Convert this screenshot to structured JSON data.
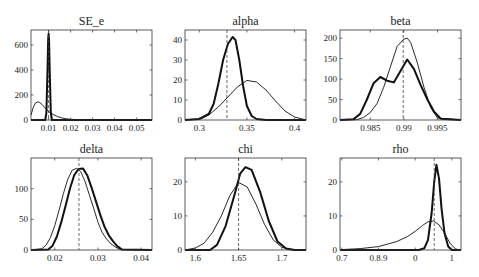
{
  "figure": {
    "line_color": "#111111",
    "frame_color": "#333333"
  },
  "chart_data": [
    {
      "type": "line",
      "title": "SE_e",
      "xlim": [
        0.002,
        0.057
      ],
      "ylim": [
        0,
        720
      ],
      "xticks": [
        0.01,
        0.02,
        0.03,
        0.04,
        0.05
      ],
      "xtick_labels": [
        "0.01",
        "0.02",
        "0.03",
        "0.04",
        "0.05"
      ],
      "yticks": [
        0,
        200,
        400,
        600
      ],
      "ytick_labels": [
        "0",
        "200",
        "400",
        "600"
      ],
      "mode_line": 0.01,
      "series": [
        {
          "name": "prior",
          "style": "thin",
          "x": [
            0.002,
            0.003,
            0.004,
            0.005,
            0.006,
            0.007,
            0.008,
            0.009,
            0.01,
            0.012,
            0.014,
            0.016,
            0.018,
            0.02,
            0.025,
            0.03,
            0.057
          ],
          "y": [
            40,
            100,
            135,
            145,
            140,
            125,
            105,
            85,
            68,
            45,
            28,
            17,
            10,
            6,
            2,
            1,
            0
          ]
        },
        {
          "name": "posterior",
          "style": "thick",
          "x": [
            0.002,
            0.0085,
            0.009,
            0.0095,
            0.0098,
            0.01,
            0.0102,
            0.0105,
            0.011,
            0.0115,
            0.057
          ],
          "y": [
            0,
            0,
            60,
            400,
            650,
            690,
            650,
            400,
            60,
            0,
            0
          ]
        }
      ]
    },
    {
      "type": "line",
      "title": "alpha",
      "xlim": [
        0.285,
        0.412
      ],
      "ylim": [
        0,
        45
      ],
      "xticks": [
        0.3,
        0.35,
        0.4
      ],
      "xtick_labels": [
        "0.3",
        "0.35",
        "0.4"
      ],
      "yticks": [
        0,
        10,
        20,
        30,
        40
      ],
      "ytick_labels": [
        "0",
        "10",
        "20",
        "30",
        "40"
      ],
      "mode_line": 0.329,
      "series": [
        {
          "name": "prior",
          "style": "thin",
          "x": [
            0.285,
            0.3,
            0.31,
            0.32,
            0.33,
            0.34,
            0.35,
            0.36,
            0.37,
            0.38,
            0.39,
            0.4,
            0.412
          ],
          "y": [
            0,
            0.5,
            2.5,
            6.5,
            11.5,
            16.5,
            19.8,
            19,
            15,
            9.5,
            4.5,
            1.5,
            0
          ]
        },
        {
          "name": "posterior",
          "style": "thick",
          "x": [
            0.285,
            0.3,
            0.31,
            0.315,
            0.32,
            0.325,
            0.33,
            0.335,
            0.338,
            0.342,
            0.346,
            0.35,
            0.355,
            0.36,
            0.37,
            0.412
          ],
          "y": [
            0,
            0.5,
            3,
            8,
            18,
            30,
            38,
            41.5,
            40,
            30,
            17,
            7,
            2,
            0.5,
            0,
            0
          ]
        }
      ]
    },
    {
      "type": "line",
      "title": "beta",
      "xlim": [
        0.9805,
        0.9985
      ],
      "ylim": [
        0,
        220
      ],
      "xticks": [
        0.985,
        0.99,
        0.995
      ],
      "xtick_labels": [
        "0.985",
        "0.99",
        "0.995"
      ],
      "yticks": [
        0,
        50,
        100,
        150,
        200
      ],
      "ytick_labels": [
        "0",
        "50",
        "100",
        "150",
        "200"
      ],
      "mode_line": 0.9899,
      "series": [
        {
          "name": "prior",
          "style": "thin",
          "x": [
            0.9805,
            0.983,
            0.984,
            0.985,
            0.986,
            0.987,
            0.988,
            0.989,
            0.99,
            0.9905,
            0.991,
            0.992,
            0.993,
            0.994,
            0.995,
            0.9985
          ],
          "y": [
            0,
            1,
            6,
            18,
            40,
            80,
            130,
            180,
            198,
            200,
            190,
            140,
            80,
            30,
            5,
            0
          ]
        },
        {
          "name": "posterior",
          "style": "thick",
          "x": [
            0.9805,
            0.9825,
            0.9835,
            0.9845,
            0.9855,
            0.9865,
            0.9875,
            0.9885,
            0.9895,
            0.9905,
            0.9915,
            0.9925,
            0.9935,
            0.9945,
            0.9955,
            0.9985
          ],
          "y": [
            0,
            2,
            15,
            50,
            90,
            105,
            96,
            92,
            120,
            148,
            125,
            85,
            50,
            20,
            3,
            0
          ]
        }
      ]
    },
    {
      "type": "line",
      "title": "delta",
      "xlim": [
        0.0145,
        0.0425
      ],
      "ylim": [
        0,
        150
      ],
      "xticks": [
        0.02,
        0.03,
        0.04
      ],
      "xtick_labels": [
        "0.02",
        "0.03",
        "0.04"
      ],
      "yticks": [
        0,
        50,
        100
      ],
      "ytick_labels": [
        "0",
        "50",
        "100"
      ],
      "mode_line": 0.0256,
      "series": [
        {
          "name": "prior",
          "style": "thin",
          "x": [
            0.0145,
            0.017,
            0.018,
            0.019,
            0.02,
            0.021,
            0.022,
            0.023,
            0.024,
            0.025,
            0.026,
            0.027,
            0.028,
            0.029,
            0.03,
            0.031,
            0.032,
            0.033,
            0.034,
            0.035,
            0.0425
          ],
          "y": [
            0,
            2,
            8,
            20,
            40,
            65,
            92,
            115,
            130,
            133,
            128,
            112,
            90,
            68,
            45,
            28,
            18,
            10,
            5,
            1,
            0
          ]
        },
        {
          "name": "posterior",
          "style": "thick",
          "x": [
            0.0145,
            0.0185,
            0.0195,
            0.0205,
            0.0215,
            0.0225,
            0.0235,
            0.0245,
            0.0255,
            0.0265,
            0.0275,
            0.0285,
            0.0295,
            0.0305,
            0.0315,
            0.0325,
            0.0335,
            0.0345,
            0.0355,
            0.0425
          ],
          "y": [
            0,
            1,
            7,
            22,
            45,
            72,
            100,
            122,
            132,
            133,
            122,
            102,
            80,
            58,
            38,
            24,
            14,
            6,
            1,
            0
          ]
        }
      ]
    },
    {
      "type": "line",
      "title": "chi",
      "xlim": [
        1.588,
        1.728
      ],
      "ylim": [
        0,
        27
      ],
      "xticks": [
        1.6,
        1.65,
        1.7
      ],
      "xtick_labels": [
        "1.6",
        "1.65",
        "1.7"
      ],
      "yticks": [
        0,
        10,
        20
      ],
      "ytick_labels": [
        "0",
        "10",
        "20"
      ],
      "mode_line": 1.65,
      "series": [
        {
          "name": "prior",
          "style": "thin",
          "x": [
            1.588,
            1.6,
            1.61,
            1.62,
            1.63,
            1.64,
            1.65,
            1.66,
            1.67,
            1.68,
            1.69,
            1.7,
            1.71,
            1.728
          ],
          "y": [
            0,
            0.6,
            2,
            5.2,
            10,
            16,
            19.8,
            18.5,
            13.5,
            7.5,
            3,
            0.8,
            0.1,
            0
          ]
        },
        {
          "name": "posterior",
          "style": "thick",
          "x": [
            1.588,
            1.617,
            1.625,
            1.635,
            1.645,
            1.652,
            1.658,
            1.665,
            1.675,
            1.685,
            1.695,
            1.705,
            1.715,
            1.728
          ],
          "y": [
            0,
            0,
            1.5,
            7,
            16,
            22.5,
            24.3,
            23.5,
            17,
            8.5,
            2.5,
            0.4,
            0,
            0
          ]
        }
      ]
    },
    {
      "type": "line",
      "title": "rho",
      "xlim": [
        0.695,
        1.025
      ],
      "ylim": [
        0,
        27
      ],
      "xticks": [
        0.7,
        0.8,
        0.9,
        1.0
      ],
      "xtick_labels": [
        "0.7",
        "0.8.9",
        "0",
        "1"
      ],
      "yticks": [
        0,
        10,
        20
      ],
      "ytick_labels": [
        "0",
        "10",
        "20"
      ],
      "mode_line": 0.952,
      "series": [
        {
          "name": "prior",
          "style": "thin",
          "x": [
            0.695,
            0.75,
            0.8,
            0.85,
            0.88,
            0.9,
            0.92,
            0.935,
            0.95,
            0.965,
            0.98,
            0.995,
            1.01,
            1.025
          ],
          "y": [
            0.1,
            0.4,
            1,
            2.5,
            4,
            5.5,
            7.2,
            8.3,
            8.5,
            7.4,
            5,
            2,
            0.3,
            0
          ]
        },
        {
          "name": "posterior",
          "style": "thick",
          "x": [
            0.695,
            0.91,
            0.925,
            0.935,
            0.945,
            0.952,
            0.958,
            0.965,
            0.972,
            0.98,
            0.99,
            1.0,
            1.025
          ],
          "y": [
            0,
            0,
            0.5,
            3,
            11,
            20,
            25,
            21,
            12,
            5,
            1,
            0,
            0
          ]
        }
      ]
    }
  ]
}
